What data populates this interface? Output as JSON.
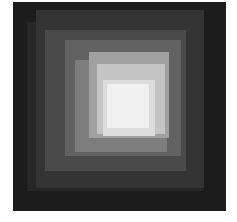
{
  "image": {
    "kind": "grayscale-mosaic-coverage-map",
    "canvas": {
      "width": 237,
      "height": 222,
      "background": "#ffffff"
    },
    "frame": {
      "label": "exposure-field",
      "x": 13,
      "y": 2,
      "width": 213,
      "height": 209,
      "background": "#1a1a1a"
    },
    "steps": [
      {
        "label": "coverage-depth-1",
        "x": 0,
        "y": 0,
        "width": 213,
        "height": 209,
        "color": "#1c1c1c"
      },
      {
        "label": "coverage-depth-2",
        "x": 14,
        "y": 20,
        "width": 176,
        "height": 169,
        "color": "#272727"
      },
      {
        "label": "coverage-depth-3",
        "x": 23,
        "y": 8,
        "width": 168,
        "height": 178,
        "color": "#343434"
      },
      {
        "label": "coverage-depth-4",
        "x": 32,
        "y": 28,
        "width": 141,
        "height": 141,
        "color": "#4a4a4a"
      },
      {
        "label": "coverage-depth-5",
        "x": 52,
        "y": 38,
        "width": 116,
        "height": 116,
        "color": "#626262"
      },
      {
        "label": "coverage-depth-6",
        "x": 62,
        "y": 58,
        "width": 92,
        "height": 92,
        "color": "#7d7d7d"
      },
      {
        "label": "coverage-depth-7",
        "x": 76,
        "y": 50,
        "width": 80,
        "height": 86,
        "color": "#a0a0a0"
      },
      {
        "label": "coverage-depth-8",
        "x": 84,
        "y": 62,
        "width": 68,
        "height": 70,
        "color": "#c4c4c4"
      },
      {
        "label": "coverage-depth-9",
        "x": 90,
        "y": 78,
        "width": 52,
        "height": 56,
        "color": "#dcdcdc"
      },
      {
        "label": "coverage-depth-10",
        "x": 94,
        "y": 82,
        "width": 42,
        "height": 44,
        "color": "#f0f0f0"
      }
    ],
    "seams": [
      {
        "label": "detector-seam-top",
        "y": 13,
        "height": 2
      },
      {
        "label": "detector-seam-bottom",
        "y": 188,
        "height": 3
      }
    ],
    "point_sources": [
      {
        "label": "point-source-1",
        "x": 197,
        "y": 143,
        "size": 4,
        "color": "#f2f2f2"
      },
      {
        "label": "point-source-2",
        "x": 189,
        "y": 61,
        "size": 3,
        "color": "#8c8c8c"
      },
      {
        "label": "point-source-3",
        "x": 14,
        "y": 97,
        "size": 3,
        "color": "#848484"
      }
    ]
  }
}
